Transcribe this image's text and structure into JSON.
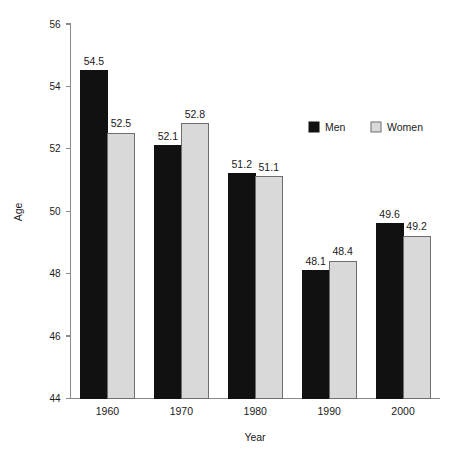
{
  "chart_data": {
    "type": "bar",
    "title": "",
    "subtitle": "",
    "xlabel": "Year",
    "ylabel": "Age",
    "categories": [
      "1960",
      "1970",
      "1980",
      "1990",
      "2000"
    ],
    "series": [
      {
        "name": "Men",
        "values": [
          54.5,
          52.1,
          51.2,
          48.1,
          49.6
        ],
        "color": "#111111"
      },
      {
        "name": "Women",
        "values": [
          52.5,
          52.8,
          51.1,
          48.4,
          49.2
        ],
        "color": "#d9d9d9"
      }
    ],
    "ylim": [
      44,
      56
    ],
    "yticks": [
      44,
      46,
      48,
      50,
      52,
      54,
      56
    ],
    "ytick_labels": [
      "44",
      "46",
      "48",
      "50",
      "52",
      "54",
      "56"
    ],
    "grid": false,
    "legend_position": "top-right",
    "value_labels_shown": true,
    "axis_color": "#8a8a8a",
    "bar_border_color": "#6e6e6e",
    "background_color": "#ffffff"
  },
  "legend": {
    "items": [
      {
        "label": "Men",
        "swatch": "black-square-icon"
      },
      {
        "label": "Women",
        "swatch": "gray-square-icon"
      }
    ]
  },
  "axes": {
    "y_title": "Age",
    "x_title": "Year"
  }
}
